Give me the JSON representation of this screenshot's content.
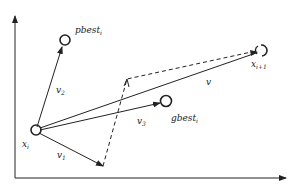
{
  "diagram": {
    "title": "",
    "labels": {
      "pbest": "pbest",
      "pbest_sub": "i",
      "gbest": "gbest",
      "gbest_sub": "i",
      "x_i": "x",
      "x_i_sub": "i",
      "x_next": "x",
      "x_next_sub": "i+1",
      "v1": "v",
      "v1_sub": "1",
      "v2": "v",
      "v2_sub": "2",
      "v3": "v",
      "v3_sub": "3",
      "v": "v"
    },
    "colors": {
      "stroke": "#222222",
      "background": "#ffffff"
    }
  }
}
